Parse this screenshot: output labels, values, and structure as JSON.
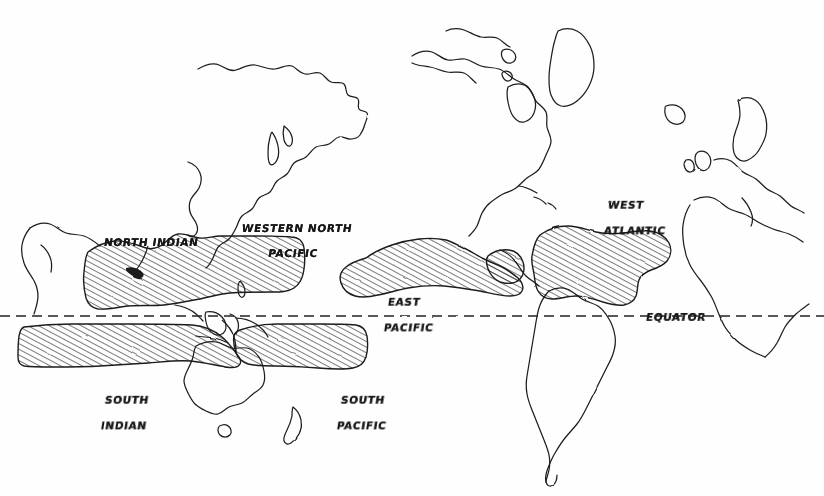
{
  "map": {
    "title": "World map of tropical cyclone basins",
    "style": "hand-drawn pen-and-ink sketch",
    "background_color": "#ffffff",
    "ink_color": "#171717",
    "projection_note": "equirectangular, Indian Ocean centered at left",
    "equator": {
      "label": "EQUATOR",
      "label_x": 646,
      "label_y": 311,
      "line_y": 316,
      "dash_length": 10,
      "dash_gap": 6,
      "color": "#222222"
    },
    "basins": [
      {
        "id": "north-indian",
        "label": "NORTH INDIAN",
        "label_x": 104,
        "label_y": 236,
        "hemisphere": "northern",
        "fill": "diagonal-hatch",
        "has_leader_line": true
      },
      {
        "id": "western-north-pacific",
        "label_lines": [
          "WESTERN NORTH",
          "PACIFIC"
        ],
        "label_x": 223,
        "label_y": 209,
        "hemisphere": "northern",
        "fill": "diagonal-hatch",
        "has_leader_line": false
      },
      {
        "id": "east-pacific",
        "label_lines": [
          "EAST",
          "PACIFIC"
        ],
        "label_x": 369,
        "label_y": 283,
        "hemisphere": "northern",
        "fill": "diagonal-hatch",
        "has_leader_line": false
      },
      {
        "id": "west-atlantic",
        "label_lines": [
          "WEST",
          "ATLANTIC"
        ],
        "label_x": 589,
        "label_y": 186,
        "hemisphere": "northern",
        "fill": "diagonal-hatch",
        "has_leader_line": false
      },
      {
        "id": "south-indian",
        "label_lines": [
          "SOUTH",
          "INDIAN"
        ],
        "label_x": 86,
        "label_y": 381,
        "hemisphere": "southern",
        "fill": "diagonal-hatch",
        "has_leader_line": false
      },
      {
        "id": "south-pacific",
        "label_lines": [
          "SOUTH",
          "PACIFIC"
        ],
        "label_x": 322,
        "label_y": 381,
        "hemisphere": "southern",
        "fill": "diagonal-hatch",
        "has_leader_line": false
      }
    ],
    "landmasses": [
      "Asia",
      "Southeast Asia",
      "Indonesia",
      "Australia",
      "Tasmania",
      "New Zealand",
      "North America",
      "Greenland",
      "Central America",
      "Caribbean islands",
      "South America",
      "Europe",
      "Scandinavia",
      "British Isles",
      "Iceland",
      "Mediterranean",
      "Africa",
      "Arabia"
    ],
    "hatch": {
      "angle_deg": 62,
      "spacing_px": 5,
      "stroke_width": 1.15,
      "color": "#1b1b1b"
    }
  }
}
